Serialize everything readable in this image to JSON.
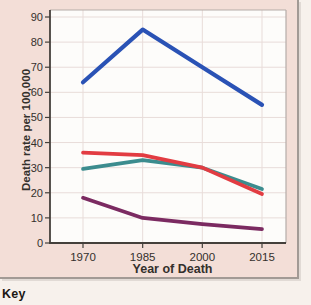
{
  "figure": {
    "key_label": "Key"
  },
  "chart_data": {
    "type": "line",
    "x": [
      1970,
      1985,
      2000,
      2015
    ],
    "x_tick_labels": [
      "1970",
      "1985",
      "2000",
      "2015"
    ],
    "xlabel": "Year of Death",
    "ylabel": "Death rate per 100,000",
    "ylim": [
      0,
      90
    ],
    "y_ticks": [
      0,
      10,
      20,
      30,
      40,
      50,
      60,
      70,
      80,
      90
    ],
    "grid": true,
    "series": [
      {
        "name": "purple-series",
        "color": "#7b2a61",
        "values": [
          18,
          10,
          7.5,
          5.5
        ]
      },
      {
        "name": "teal-series",
        "color": "#3c8c8e",
        "values": [
          29.5,
          33,
          30,
          21.5
        ]
      },
      {
        "name": "red-series",
        "color": "#e23c42",
        "values": [
          36,
          35,
          30,
          19.5
        ]
      },
      {
        "name": "blue-series",
        "color": "#2a52b5",
        "values": [
          64,
          85,
          70,
          55
        ]
      }
    ]
  },
  "colors": {
    "page_bg": "#f7f1ec",
    "figure_bg": "#f3ded7",
    "plot_bg": "#fdfcfa",
    "grid": "#e8dcd9",
    "box_border": "#b5aca8",
    "axis": "#44403b",
    "text": "#33302c"
  }
}
